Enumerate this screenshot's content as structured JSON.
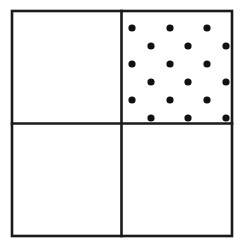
{
  "figure": {
    "name": "quadrant-square-with-shaded-upper-right",
    "canvas": {
      "width": 245,
      "height": 249,
      "background": "#fefefe"
    },
    "stroke_color": "#1a1a1a",
    "fill_color": "#111111",
    "outer_square": {
      "x": 12,
      "y": 11,
      "width": 220,
      "height": 225,
      "stroke_width": 2.6
    },
    "dividers": {
      "vertical_x": 121.5,
      "horizontal_y": 123.5,
      "stroke_width": 2.6
    },
    "quadrants": [
      {
        "id": "top-left",
        "label": "",
        "shaded": false,
        "x": 12,
        "y": 11,
        "width": 109.5,
        "height": 112.5
      },
      {
        "id": "top-right",
        "label": "",
        "shaded": true,
        "x": 121.5,
        "y": 11,
        "width": 110.5,
        "height": 112.5
      },
      {
        "id": "bottom-left",
        "label": "",
        "shaded": false,
        "x": 12,
        "y": 123.5,
        "width": 109.5,
        "height": 112.5
      },
      {
        "id": "bottom-right",
        "label": "",
        "shaded": false,
        "x": 121.5,
        "y": 123.5,
        "width": 110.5,
        "height": 112.5
      }
    ],
    "dot_pattern": {
      "shape": "circle",
      "radius": 3.6,
      "row_spacing": 18,
      "column_spacing": 37,
      "stagger_offset": 19,
      "rows": [
        {
          "y": 28,
          "x": [
            132,
            170,
            207
          ]
        },
        {
          "y": 46,
          "x": [
            151,
            188,
            226
          ]
        },
        {
          "y": 64,
          "x": [
            132,
            170,
            207
          ]
        },
        {
          "y": 82,
          "x": [
            151,
            188,
            226
          ]
        },
        {
          "y": 100,
          "x": [
            132,
            170,
            207
          ]
        },
        {
          "y": 118,
          "x": [
            151,
            188,
            226
          ]
        }
      ],
      "total_dots": 18
    }
  }
}
